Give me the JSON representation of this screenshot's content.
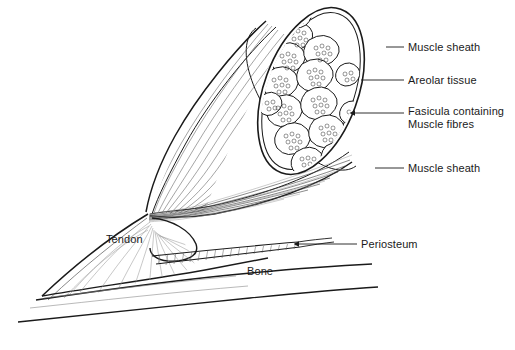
{
  "figure": {
    "title_visible": false,
    "background_color": "#ffffff",
    "ink_color": "#1a1a1a",
    "width": 515,
    "height": 350
  },
  "labels": [
    {
      "id": "muscle-sheath-top",
      "text": "Muscle sheath",
      "x": 408,
      "y": 41
    },
    {
      "id": "areolar-tissue",
      "text": "Areolar tissue",
      "x": 408,
      "y": 74
    },
    {
      "id": "fasicula-line1",
      "text": "Fasicula containing",
      "x": 408,
      "y": 105
    },
    {
      "id": "fasicula-line2",
      "text": "Muscle fibres",
      "x": 408,
      "y": 118
    },
    {
      "id": "muscle-sheath-bottom",
      "text": "Muscle sheath",
      "x": 408,
      "y": 162
    },
    {
      "id": "periosteum",
      "text": "Periosteum",
      "x": 361,
      "y": 238
    },
    {
      "id": "tendon",
      "text": "Tendon",
      "x": 106,
      "y": 233
    },
    {
      "id": "bone",
      "text": "Bone",
      "x": 247,
      "y": 265
    }
  ],
  "leaders": [
    {
      "id": "leader-muscle-sheath-top",
      "x1": 386,
      "y1": 47,
      "x2": 404,
      "y2": 47,
      "anchor_x": 330,
      "anchor_y": 30
    },
    {
      "id": "leader-areolar-tissue",
      "x1": 361,
      "y1": 80,
      "x2": 404,
      "y2": 80
    },
    {
      "id": "leader-fasicula",
      "x1": 355,
      "y1": 113,
      "x2": 404,
      "y2": 113,
      "arrow": true
    },
    {
      "id": "leader-muscle-sheath-bottom",
      "x1": 375,
      "y1": 168,
      "x2": 404,
      "y2": 168
    },
    {
      "id": "leader-periosteum",
      "x1": 299,
      "y1": 244,
      "x2": 357,
      "y2": 244,
      "arrow": true
    }
  ],
  "parts": {
    "muscle_belly": "fusiform belly with longitudinal fibre striations converging to tendon",
    "cut_face": "oblique elliptical cross-section showing fascicles",
    "fascicle_count": 17,
    "tendon": "flat fan-shaped aponeurosis spreading onto bone",
    "periosteum": "hatched membrane layer over bone surface",
    "bone": "long bone shaft drawn with two contour lines"
  }
}
